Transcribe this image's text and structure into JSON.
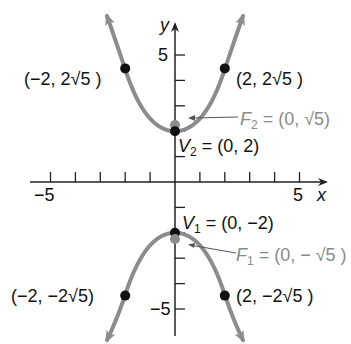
{
  "diagram": {
    "axes": {
      "x_label": "x",
      "y_label": "y",
      "x_tick_labels": [
        "−5",
        "5"
      ],
      "y_tick_labels": [
        "5",
        "−5"
      ],
      "x_range": [
        -6,
        6
      ],
      "y_range": [
        -6,
        6
      ]
    },
    "points": {
      "v2": {
        "name": "V",
        "sub": "2",
        "value": " = (0, 2)"
      },
      "v1": {
        "name": "V",
        "sub": "1",
        "value": " = (0, −2)"
      },
      "f2": {
        "name": "F",
        "sub": "2",
        "value": " = (0, √5)"
      },
      "f1": {
        "name": "F",
        "sub": "1",
        "value": " = (0, − √5 )"
      },
      "ul": "(−2, 2√5 )",
      "ur": "(2, 2√5 )",
      "ll": "(−2, −2√5)",
      "lr": "(2, −2√5 )"
    },
    "colors": {
      "curve": "#8c8c8c",
      "vertex": "#111111",
      "focus": "#8c8c8c",
      "axis": "#222222"
    }
  }
}
